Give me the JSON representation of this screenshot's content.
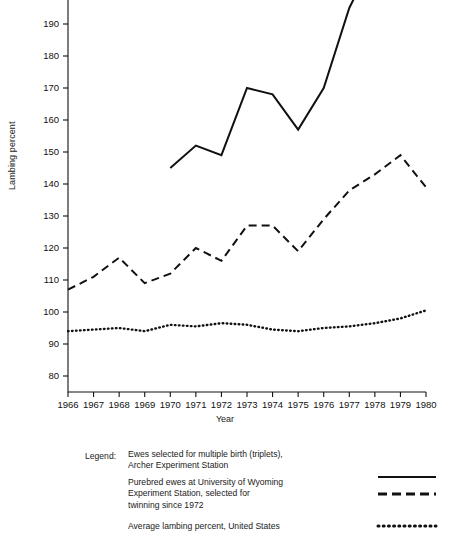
{
  "chart_data": {
    "type": "line",
    "title": "",
    "xlabel": "Year",
    "ylabel": "Lambing percent",
    "x": [
      1966,
      1967,
      1968,
      1969,
      1970,
      1971,
      1972,
      1973,
      1974,
      1975,
      1976,
      1977,
      1978,
      1979,
      1980
    ],
    "xlim": [
      1966,
      1980
    ],
    "ylim": [
      75,
      213
    ],
    "yticks": [
      80,
      90,
      100,
      110,
      120,
      130,
      140,
      150,
      160,
      170,
      180,
      190,
      200,
      210
    ],
    "xticks": [
      "1966",
      "1967",
      "1968",
      "1969",
      "1970",
      "1971",
      "1972",
      "1973",
      "1974",
      "1975",
      "1976",
      "1977",
      "1978",
      "1979",
      "1980"
    ],
    "grid": false,
    "legend_position": "below",
    "series": [
      {
        "name": "Ewes selected for multiple birth (triplets), Archer Experiment Station",
        "style": "solid",
        "x": [
          1970,
          1971,
          1972,
          1973,
          1974,
          1975,
          1976,
          1977,
          1978,
          1979,
          1980
        ],
        "values": [
          145,
          152,
          149,
          170,
          168,
          157,
          170,
          195,
          211,
          204,
          213
        ]
      },
      {
        "name": "Purebred ewes at University of Wyoming Experiment Station, selected for twinning since 1972",
        "style": "dashed",
        "x": [
          1966,
          1967,
          1968,
          1969,
          1970,
          1971,
          1972,
          1973,
          1974,
          1975,
          1976,
          1977,
          1978,
          1979,
          1980
        ],
        "values": [
          107,
          111,
          117,
          109,
          112,
          120,
          116,
          127,
          127,
          119,
          129,
          138,
          143,
          149,
          139
        ]
      },
      {
        "name": "Average lambing percent, United States",
        "style": "dotted",
        "x": [
          1966,
          1967,
          1968,
          1969,
          1970,
          1971,
          1972,
          1973,
          1974,
          1975,
          1976,
          1977,
          1978,
          1979,
          1980
        ],
        "values": [
          94,
          94.5,
          95,
          94,
          96,
          95.5,
          96.5,
          96,
          94.5,
          94,
          95,
          95.5,
          96.5,
          98,
          100.5
        ]
      }
    ]
  },
  "axes": {
    "ylabel": "Lambing percent",
    "xlabel": "Year"
  },
  "legend": {
    "label": "Legend:",
    "entries": [
      {
        "line1": "Ewes selected for multiple birth (triplets),",
        "line2": "Archer Experiment Station",
        "line3": "",
        "style": "solid"
      },
      {
        "line1": "Purebred ewes at University of Wyoming",
        "line2": "Experiment Station, selected for",
        "line3": "twinning since 1972",
        "style": "dashed"
      },
      {
        "line1": "Average lambing percent, United States",
        "line2": "",
        "line3": "",
        "style": "dotted"
      }
    ]
  }
}
